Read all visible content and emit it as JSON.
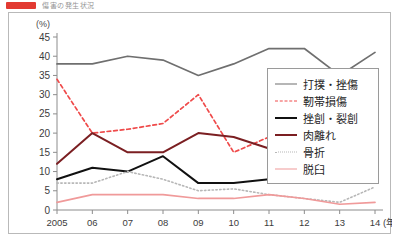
{
  "header": {
    "badge_color": "#e23a32",
    "title": "傷害の発生状況"
  },
  "chart_data": {
    "type": "line",
    "title": "",
    "subtitle": "",
    "xlabel": "(年)",
    "ylabel": "(%)",
    "ylim": [
      0,
      45
    ],
    "ytick_step": 5,
    "yticks": [
      "0",
      "5",
      "10",
      "15",
      "20",
      "25",
      "30",
      "35",
      "40",
      "45"
    ],
    "grid": false,
    "legend_position": "right-inside",
    "x": [
      "2005",
      "06",
      "07",
      "08",
      "09",
      "10",
      "11",
      "12",
      "13",
      "14"
    ],
    "categories": [
      "2005",
      "06",
      "07",
      "08",
      "09",
      "10",
      "11",
      "12",
      "13",
      "14"
    ],
    "series": [
      {
        "name": "打撲・挫傷",
        "color": "#6f6f6f",
        "style": "solid",
        "width": 1.7,
        "values": [
          38,
          38,
          40,
          39,
          35,
          38,
          42,
          42,
          35,
          41
        ]
      },
      {
        "name": "靭帯損傷",
        "color": "#ef4a4a",
        "style": "dashed",
        "width": 1.7,
        "values": [
          34,
          20,
          21,
          22.5,
          30,
          15,
          19,
          19.5,
          20,
          19
        ]
      },
      {
        "name": "挫創・裂創",
        "color": "#111111",
        "style": "solid",
        "width": 2.0,
        "values": [
          8,
          11,
          10,
          14,
          7,
          7,
          8,
          9,
          15,
          10.5
        ]
      },
      {
        "name": "肉離れ",
        "color": "#7b1f22",
        "style": "solid",
        "width": 2.0,
        "values": [
          12,
          20,
          15,
          15,
          20,
          19,
          16,
          17,
          16,
          21
        ]
      },
      {
        "name": "骨折",
        "color": "#b7b7b7",
        "style": "dotted",
        "width": 1.6,
        "values": [
          7,
          7,
          10,
          8,
          5,
          5.5,
          4,
          3,
          2,
          6
        ]
      },
      {
        "name": "脱臼",
        "color": "#f09a9a",
        "style": "solid",
        "width": 1.7,
        "values": [
          2,
          4,
          4,
          4,
          3,
          3,
          4,
          3,
          1.5,
          2
        ]
      }
    ]
  }
}
